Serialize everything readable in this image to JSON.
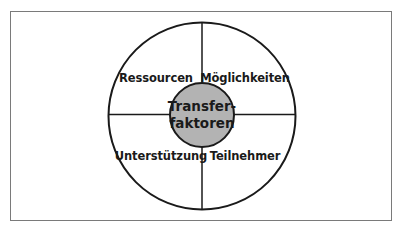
{
  "diagram": {
    "center": {
      "line1": "Transfer-",
      "line2": "faktoren",
      "fill": "#b3b3b3"
    },
    "quadrants": [
      {
        "position": "top-left",
        "label": "Ressourcen"
      },
      {
        "position": "top-right",
        "label": "Möglichkeiten"
      },
      {
        "position": "bottom-left",
        "label": "Unterstützung"
      },
      {
        "position": "bottom-right",
        "label": "Teilnehmer"
      }
    ],
    "colors": {
      "stroke": "#1a1a1a",
      "frame": "#7a7a7a",
      "background": "#ffffff"
    }
  }
}
